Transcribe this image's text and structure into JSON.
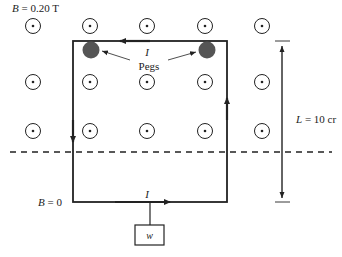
{
  "diagram": {
    "field_region_label": "B = 0.20 T",
    "field_free_label": "B = 0",
    "current_top_label": "I",
    "current_bottom_label": "I",
    "pegs_label": "Pegs",
    "length_label": "L = 10 cr",
    "weight_label": "w",
    "field_symbol": "dot-out-of-page",
    "colors": {
      "line": "#222222",
      "peg": "#555555",
      "background": "#ffffff"
    }
  }
}
